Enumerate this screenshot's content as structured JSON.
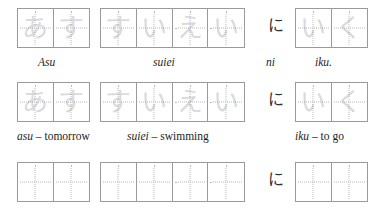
{
  "worksheet": {
    "title": "Japanese hiragana handwriting practice sheet",
    "ink_color": "#2f2f2f",
    "grid_border_color": "#9a9a9a",
    "guide_dot_color": "#b9b9b9",
    "trace_color": "rgba(120,125,135,0.30)"
  },
  "rows": [
    {
      "id": "row-sentence",
      "groups": [
        {
          "name": "asu",
          "cells": 2,
          "trace": [
            "あ",
            "す"
          ],
          "caption_italic": "Asu",
          "caption_rest": ""
        },
        {
          "name": "suiei",
          "cells": 4,
          "trace": [
            "す",
            "い",
            "え",
            "い"
          ],
          "caption_italic": "suiei",
          "caption_rest": ""
        },
        {
          "name": "iku",
          "cells": 2,
          "trace": [
            "い",
            "く"
          ],
          "caption_italic": "iku.",
          "caption_rest": ""
        }
      ],
      "particle": {
        "glyph": "に",
        "caption_italic": "ni",
        "caption_rest": ""
      }
    },
    {
      "id": "row-vocabulary",
      "groups": [
        {
          "name": "asu",
          "cells": 2,
          "trace": [
            "あ",
            "す"
          ],
          "caption_italic": "asu",
          "caption_rest": " – tomorrow"
        },
        {
          "name": "suiei",
          "cells": 4,
          "trace": [
            "す",
            "い",
            "え",
            "い"
          ],
          "caption_italic": "suiei",
          "caption_rest": " – swimming"
        },
        {
          "name": "iku",
          "cells": 2,
          "trace": [
            "い",
            "く"
          ],
          "caption_italic": "iku",
          "caption_rest": " – to go"
        }
      ],
      "particle": {
        "glyph": "に",
        "caption_italic": "",
        "caption_rest": ""
      }
    },
    {
      "id": "row-blank",
      "groups": [
        {
          "name": "asu",
          "cells": 2,
          "trace": [
            "",
            ""
          ],
          "caption_italic": "",
          "caption_rest": ""
        },
        {
          "name": "suiei",
          "cells": 4,
          "trace": [
            "",
            "",
            "",
            ""
          ],
          "caption_italic": "",
          "caption_rest": ""
        },
        {
          "name": "iku",
          "cells": 2,
          "trace": [
            "",
            ""
          ],
          "caption_italic": "",
          "caption_rest": ""
        }
      ],
      "particle": {
        "glyph": "に",
        "caption_italic": "",
        "caption_rest": ""
      }
    }
  ]
}
